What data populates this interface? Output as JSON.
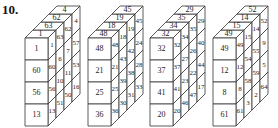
{
  "problem_label": "10.",
  "geometry": {
    "cell_w": 23,
    "cell_h": 22,
    "dx": 8,
    "dy": -8,
    "front_top": 38
  },
  "cubes": [
    {
      "origin_x": 25,
      "top": [
        "1",
        "63",
        "62",
        "4"
      ],
      "front": [
        "1",
        "60",
        "56",
        "13"
      ],
      "side": [
        [
          "1",
          "60",
          "56",
          "13"
        ],
        [
          "63",
          "6",
          "10",
          "51"
        ],
        [
          "62",
          "7",
          "11",
          "50"
        ],
        [
          "4",
          "57",
          "53",
          "16"
        ]
      ]
    },
    {
      "origin_x": 88,
      "top": [
        "48",
        "18",
        "19",
        "45"
      ],
      "front": [
        "48",
        "21",
        "25",
        "36"
      ],
      "side": [
        [
          "48",
          "21",
          "25",
          "36"
        ],
        [
          "18",
          "43",
          "39",
          "30"
        ],
        [
          "19",
          "42",
          "38",
          "31"
        ],
        [
          "45",
          "24",
          "28",
          "33"
        ]
      ]
    },
    {
      "origin_x": 150,
      "top": [
        "32",
        "34",
        "35",
        "29"
      ],
      "front": [
        "32",
        "37",
        "41",
        "20"
      ],
      "side": [
        [
          "32",
          "37",
          "41",
          "20"
        ],
        [
          "34",
          "27",
          "23",
          "46"
        ],
        [
          "35",
          "26",
          "22",
          "47"
        ],
        [
          "29",
          "40",
          "44",
          "17"
        ]
      ]
    },
    {
      "origin_x": 213,
      "top": [
        "49",
        "15",
        "14",
        "52"
      ],
      "front": [
        "49",
        "12",
        "8",
        "61"
      ],
      "side": [
        [
          "49",
          "12",
          "8",
          "61"
        ],
        [
          "15",
          "54",
          "58",
          "3"
        ],
        [
          "14",
          "55",
          "59",
          "2"
        ],
        [
          "52",
          "9",
          "5",
          "64"
        ]
      ]
    }
  ]
}
